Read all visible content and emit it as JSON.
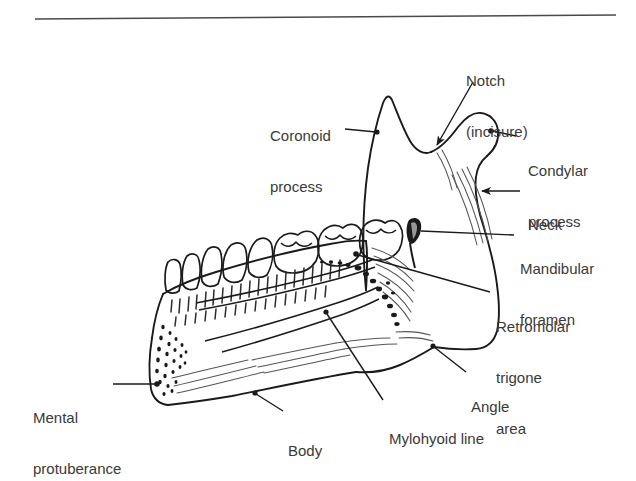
{
  "figure": {
    "style": "black-and-white line art with hatching and stippling",
    "background_color": "#ffffff",
    "ink_color": "#1a1a1a",
    "text_color": "#3a3a3a",
    "rule": {
      "present": true,
      "x1": 35,
      "y1": 19,
      "x2": 616,
      "y2": 15
    }
  },
  "labels": {
    "coronoid_process": {
      "line1": "Coronoid",
      "line2": "process"
    },
    "notch": {
      "line1": "Notch",
      "line2": "(incisure)"
    },
    "condylar_process": {
      "line1": "Condylar",
      "line2": "process"
    },
    "neck": {
      "line1": "Neck"
    },
    "mandibular_foramen": {
      "line1": "Mandibular",
      "line2": "foramen"
    },
    "retromolar_trigone": {
      "line1": "Retromolar",
      "line2": "trigone",
      "line3": "area"
    },
    "angle": {
      "line1": "Angle"
    },
    "mylohyoid_line": {
      "line1": "Mylohyoid line"
    },
    "body": {
      "line1": "Body"
    },
    "mental_protuberance": {
      "line1": "Mental",
      "line2": "protuberance"
    }
  }
}
